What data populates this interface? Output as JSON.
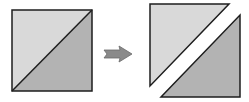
{
  "diagram": {
    "colors": {
      "light_fill": "#d9d9d9",
      "dark_fill": "#b3b3b3",
      "stroke": "#1e1e1e",
      "arrow_fill": "#8a8a8a",
      "arrow_stroke": "#6a6a6a",
      "background": "#ffffff"
    },
    "left_square": {
      "light_triangle": "12,10 92,10 12,91",
      "dark_triangle": "92,10 92,91 12,91",
      "outline": "12,10 92,10 92,91 12,91",
      "diagonal": "12,91 92,10"
    },
    "arrow": {
      "points": "104,50 120,50 119,46 132,54 119,62 120,58 104,58 107,54"
    },
    "right_pieces": {
      "upper_light_triangle": "150,4 229,4 150,86",
      "lower_dark_triangle": "240,15 240,97 161,97"
    }
  }
}
